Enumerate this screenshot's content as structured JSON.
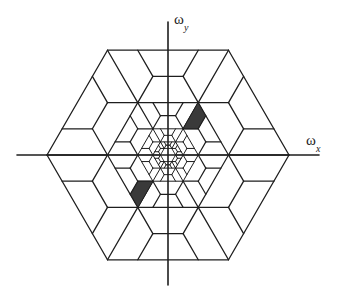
{
  "figure": {
    "center": [
      168,
      155
    ],
    "outer_radius": 121,
    "levels": [
      1,
      0.5,
      0.25,
      0.125
    ],
    "innermost_hexagon_scale": 0.0625,
    "line_color": "#1e1e1e",
    "shade_color": "#3a3a3a",
    "axes": {
      "x": {
        "from": 17,
        "to": 319,
        "y": 155
      },
      "y": {
        "from": 22,
        "to": 285,
        "x": 168
      }
    },
    "shaded_cells": [
      {
        "name": "upper-right-cell",
        "points": [
          [
            198,
            102.5
          ],
          [
            205.5,
            115.6
          ],
          [
            198,
            128.75
          ],
          [
            183,
            128.75
          ]
        ]
      },
      {
        "name": "lower-left-cell",
        "points": [
          [
            138,
            207.5
          ],
          [
            130.5,
            194.4
          ],
          [
            138,
            181.25
          ],
          [
            153,
            181.25
          ]
        ]
      }
    ]
  },
  "labels": {
    "x_axis": {
      "base": "ω",
      "sub": "x"
    },
    "y_axis": {
      "base": "ω",
      "sub": "y"
    }
  }
}
